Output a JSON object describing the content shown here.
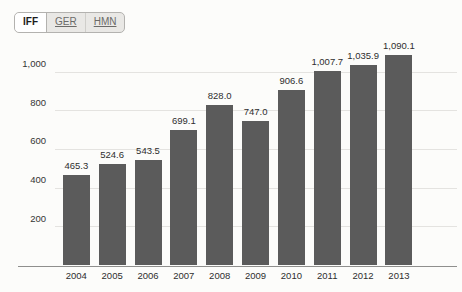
{
  "tabs": {
    "items": [
      {
        "label": "IFF",
        "active": true
      },
      {
        "label": "GER",
        "active": false
      },
      {
        "label": "HMN",
        "active": false
      }
    ]
  },
  "chart_data": {
    "type": "bar",
    "title": "",
    "xlabel": "",
    "ylabel": "",
    "categories": [
      "2004",
      "2005",
      "2006",
      "2007",
      "2008",
      "2009",
      "2010",
      "2011",
      "2012",
      "2013"
    ],
    "values": [
      465.3,
      524.6,
      543.5,
      699.1,
      828.0,
      747.0,
      906.6,
      1007.7,
      1035.9,
      1090.1
    ],
    "value_labels": [
      "465.3",
      "524.6",
      "543.5",
      "699.1",
      "828.0",
      "747.0",
      "906.6",
      "1,007.7",
      "1,035.9",
      "1,090.1"
    ],
    "yticks": [
      200,
      400,
      600,
      800,
      1000
    ],
    "ytick_labels": [
      "200",
      "400",
      "600",
      "800",
      "1,000"
    ],
    "ylim": [
      0,
      1130
    ],
    "grid": true,
    "legend_position": "none",
    "colors": {
      "bar": "#5b5b5b",
      "gridline": "#e4e3e0",
      "axis_line": "#8f8f8d",
      "label_text": "#2e2e2e"
    }
  }
}
